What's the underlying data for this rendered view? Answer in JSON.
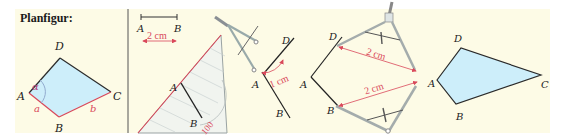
{
  "title": "Planfigur:",
  "colors": {
    "panel_bg": "#fdfbe6",
    "fill": "#cdeefa",
    "stroke": "#2a2a2a",
    "accent": "#d9485a",
    "divider": "#555555"
  },
  "panels": {
    "planfigur": {
      "vertices": {
        "A": "A",
        "B": "B",
        "C": "C",
        "D": "D"
      },
      "sides": {
        "a": "a",
        "b": "b"
      },
      "angle": "α"
    },
    "step1": {
      "segment_labels": {
        "A": "A",
        "B": "B"
      },
      "measure": "2 cm",
      "triangle_labels": {
        "A": "A",
        "B": "B"
      },
      "protractor_mark": "100"
    },
    "step2": {
      "labels": {
        "D": "D",
        "A": "A",
        "B": "B"
      },
      "measure": "1 cm"
    },
    "step3": {
      "labels": {
        "D": "D",
        "A": "A",
        "B": "B"
      },
      "measure_top": "2 cm",
      "measure_bottom": "2 cm"
    },
    "result": {
      "labels": {
        "A": "A",
        "B": "B",
        "C": "C",
        "D": "D"
      }
    }
  }
}
